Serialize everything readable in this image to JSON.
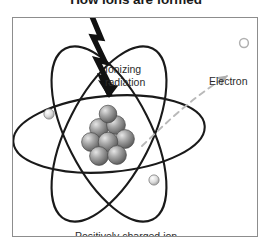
{
  "title": "How ions are formed",
  "figure": {
    "labels": {
      "ionizing_radiation": "Ionizing\nradiation",
      "electron": "Electron",
      "positive_ion": "Positively charged ion"
    },
    "colors": {
      "frame": "#8d8d8d",
      "background": "#ffffff",
      "orbit": "#1a1a1a",
      "bolt": "#111111",
      "nucleon": "#8a8a8a",
      "electron_sphere": "#cfcfcf",
      "ejection_path": "#b9b9b9",
      "text": "#2b2b2b"
    },
    "elements": {
      "orbit_count": 3,
      "bound_electron_count": 2,
      "nucleon_count": 8,
      "ejected_electron_count": 1,
      "radiation_arrow": "lightning-bolt",
      "ejection_arrow": "dashed-arrow"
    }
  }
}
